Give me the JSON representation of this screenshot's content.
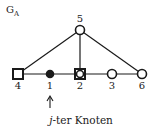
{
  "graph": {
    "title": "G",
    "title_subscript": "A",
    "nodes": [
      {
        "id": "5",
        "label": "5",
        "x": 80,
        "y": 30,
        "shape": "circle",
        "label_pos": "above"
      },
      {
        "id": "4",
        "label": "4",
        "x": 18,
        "y": 74,
        "shape": "square",
        "label_pos": "below"
      },
      {
        "id": "1",
        "label": "1",
        "x": 50,
        "y": 74,
        "shape": "filled-circle",
        "label_pos": "below"
      },
      {
        "id": "2",
        "label": "2",
        "x": 80,
        "y": 74,
        "shape": "square-circle",
        "label_pos": "below"
      },
      {
        "id": "3",
        "label": "3",
        "x": 112,
        "y": 74,
        "shape": "circle",
        "label_pos": "below"
      },
      {
        "id": "6",
        "label": "6",
        "x": 142,
        "y": 74,
        "shape": "circle",
        "label_pos": "below"
      }
    ],
    "edges": [
      [
        "5",
        "4"
      ],
      [
        "5",
        "2"
      ],
      [
        "5",
        "6"
      ],
      [
        "4",
        "1"
      ],
      [
        "1",
        "2"
      ],
      [
        "2",
        "3"
      ],
      [
        "3",
        "6"
      ]
    ],
    "pointer": {
      "target": "1",
      "arrow": "↑"
    },
    "caption": {
      "italic": "j",
      "rest": "-ter Knoten"
    }
  }
}
